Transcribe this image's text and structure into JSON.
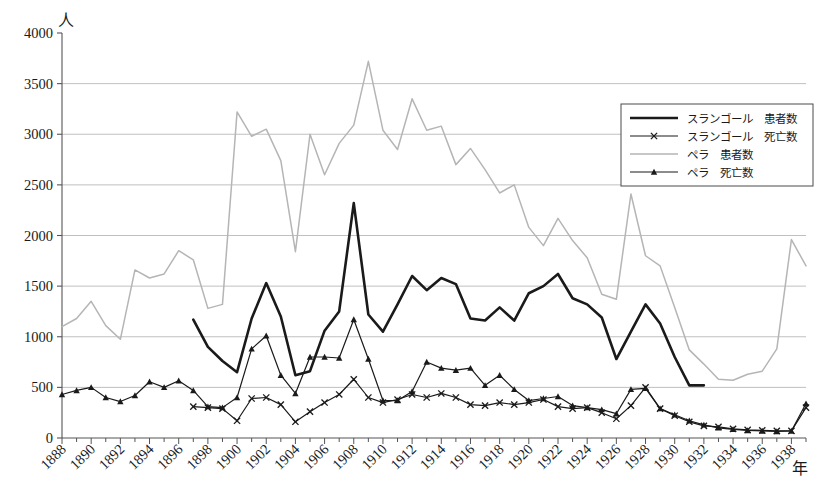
{
  "chart_data": {
    "type": "line",
    "title": "",
    "xlabel": "年",
    "ylabel": "人",
    "ylim": [
      0,
      4000
    ],
    "xlim": [
      1888,
      1939
    ],
    "ytick_values": [
      0,
      500,
      1000,
      1500,
      2000,
      2500,
      3000,
      3500,
      4000
    ],
    "ytick_labels": [
      "0",
      "500",
      "1000",
      "1500",
      "2000",
      "2500",
      "3000",
      "3500",
      "4000"
    ],
    "xtick_labels": [
      "1888",
      "1890",
      "1892",
      "1894",
      "1896",
      "1898",
      "1900",
      "1902",
      "1904",
      "1906",
      "1908",
      "1910",
      "1912",
      "1914",
      "1916",
      "1918",
      "1920",
      "1922",
      "1924",
      "1926",
      "1928",
      "1930",
      "1932",
      "1934",
      "1936",
      "1938"
    ],
    "grid": "horizontal",
    "legend_position": "upper-right",
    "x": [
      1888,
      1889,
      1890,
      1891,
      1892,
      1893,
      1894,
      1895,
      1896,
      1897,
      1898,
      1899,
      1900,
      1901,
      1902,
      1903,
      1904,
      1905,
      1906,
      1907,
      1908,
      1909,
      1910,
      1911,
      1912,
      1913,
      1914,
      1915,
      1916,
      1917,
      1918,
      1919,
      1920,
      1921,
      1922,
      1923,
      1924,
      1925,
      1926,
      1927,
      1928,
      1929,
      1930,
      1931,
      1932,
      1933,
      1934,
      1935,
      1936,
      1937,
      1938,
      1939
    ],
    "series": [
      {
        "name": "スランゴール　患者数",
        "key": "selangor_patients",
        "color": "#1a1a1a",
        "width": 2.6,
        "marker": "none",
        "x": [
          1897,
          1898,
          1899,
          1900,
          1901,
          1902,
          1903,
          1904,
          1905,
          1906,
          1907,
          1908,
          1909,
          1910,
          1911,
          1912,
          1913,
          1914,
          1915,
          1916,
          1917,
          1918,
          1919,
          1920,
          1921,
          1922,
          1923,
          1924,
          1925,
          1926,
          1927,
          1928,
          1929,
          1930,
          1931,
          1932
        ],
        "values": [
          1170,
          900,
          760,
          650,
          1180,
          1530,
          1200,
          620,
          660,
          1060,
          1250,
          2320,
          1220,
          1050,
          1320,
          1600,
          1460,
          1580,
          1520,
          1180,
          1160,
          1290,
          1160,
          1430,
          1500,
          1620,
          1380,
          1320,
          1190,
          780,
          1050,
          1320,
          1130,
          800,
          520,
          520
        ]
      },
      {
        "name": "スランゴール　死亡数",
        "key": "selangor_deaths",
        "color": "#1a1a1a",
        "width": 1.2,
        "marker": "x",
        "x": [
          1897,
          1898,
          1899,
          1900,
          1901,
          1902,
          1903,
          1904,
          1905,
          1906,
          1907,
          1908,
          1909,
          1910,
          1911,
          1912,
          1913,
          1914,
          1915,
          1916,
          1917,
          1918,
          1919,
          1920,
          1921,
          1922,
          1923,
          1924,
          1925,
          1926,
          1927,
          1928,
          1929,
          1930,
          1931,
          1932,
          1933,
          1934,
          1935,
          1936,
          1937,
          1938,
          1939
        ],
        "values": [
          310,
          300,
          290,
          170,
          390,
          400,
          330,
          160,
          260,
          350,
          430,
          580,
          400,
          350,
          380,
          430,
          400,
          440,
          400,
          330,
          320,
          350,
          330,
          350,
          380,
          310,
          290,
          300,
          250,
          190,
          320,
          500,
          290,
          220,
          160,
          120,
          110,
          90,
          80,
          75,
          70,
          70,
          300
        ]
      },
      {
        "name": "ペラ　患者数",
        "key": "perak_patients",
        "color": "#b5b5b5",
        "width": 1.5,
        "marker": "none",
        "x": [
          1888,
          1889,
          1890,
          1891,
          1892,
          1893,
          1894,
          1895,
          1896,
          1897,
          1898,
          1899,
          1900,
          1901,
          1902,
          1903,
          1904,
          1905,
          1906,
          1907,
          1908,
          1909,
          1910,
          1911,
          1912,
          1913,
          1914,
          1915,
          1916,
          1917,
          1918,
          1919,
          1920,
          1921,
          1922,
          1923,
          1924,
          1925,
          1926,
          1927,
          1928,
          1929,
          1930,
          1931,
          1932,
          1933,
          1934,
          1935,
          1936,
          1937,
          1938,
          1939
        ],
        "values": [
          1100,
          1180,
          1350,
          1110,
          975,
          1660,
          1580,
          1620,
          1850,
          1760,
          1280,
          1320,
          3220,
          2980,
          3050,
          2740,
          1840,
          3000,
          2600,
          2910,
          3090,
          3720,
          3040,
          2850,
          3350,
          3040,
          3080,
          2700,
          2860,
          2650,
          2420,
          2500,
          2080,
          1900,
          2170,
          1950,
          1780,
          1420,
          1370,
          2410,
          1800,
          1700,
          1290,
          870,
          730,
          580,
          570,
          630,
          660,
          880,
          1960,
          1700
        ]
      },
      {
        "name": "ペラ　死亡数",
        "key": "perak_deaths",
        "color": "#1a1a1a",
        "width": 1.2,
        "marker": "triangle",
        "x": [
          1888,
          1889,
          1890,
          1891,
          1892,
          1893,
          1894,
          1895,
          1896,
          1897,
          1898,
          1899,
          1900,
          1901,
          1902,
          1903,
          1904,
          1905,
          1906,
          1907,
          1908,
          1909,
          1910,
          1911,
          1912,
          1913,
          1914,
          1915,
          1916,
          1917,
          1918,
          1919,
          1920,
          1921,
          1922,
          1923,
          1924,
          1925,
          1926,
          1927,
          1928,
          1929,
          1930,
          1931,
          1932,
          1933,
          1934,
          1935,
          1936,
          1937,
          1938,
          1939
        ],
        "values": [
          430,
          470,
          500,
          400,
          360,
          420,
          555,
          500,
          565,
          470,
          310,
          300,
          400,
          880,
          1010,
          620,
          440,
          800,
          800,
          790,
          1170,
          780,
          370,
          370,
          460,
          750,
          690,
          670,
          690,
          520,
          620,
          480,
          370,
          390,
          410,
          320,
          300,
          280,
          240,
          480,
          490,
          290,
          230,
          170,
          130,
          100,
          85,
          75,
          70,
          65,
          70,
          340
        ]
      }
    ]
  },
  "legend": {
    "items": [
      {
        "label": "スランゴール　患者数",
        "style": "thick-black"
      },
      {
        "label": "スランゴール　死亡数",
        "style": "black-x"
      },
      {
        "label": "ペラ　患者数",
        "style": "light-gray"
      },
      {
        "label": "ペラ　死亡数",
        "style": "black-triangle"
      }
    ]
  },
  "axes": {
    "y_unit": "人",
    "x_unit": "年"
  },
  "colors": {
    "selangor": "#1a1a1a",
    "perak": "#b5b5b5",
    "grid": "#b9b9b9",
    "axis": "#555555",
    "background": "#ffffff"
  }
}
